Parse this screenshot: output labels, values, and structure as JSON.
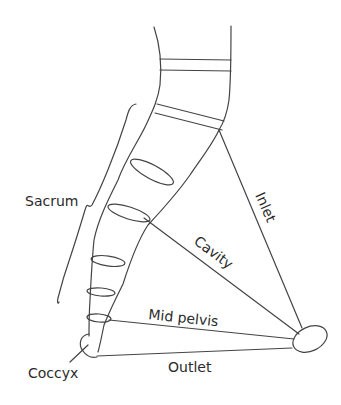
{
  "diagram": {
    "labels": {
      "sacrum": "Sacrum",
      "coccyx": "Coccyx",
      "inlet": "Inlet",
      "cavity": "Cavity",
      "mid_pelvis": "Mid pelvis",
      "outlet": "Outlet"
    },
    "colors": {
      "line": "#444444",
      "text": "#2a2a2a",
      "background": "#ffffff"
    }
  }
}
